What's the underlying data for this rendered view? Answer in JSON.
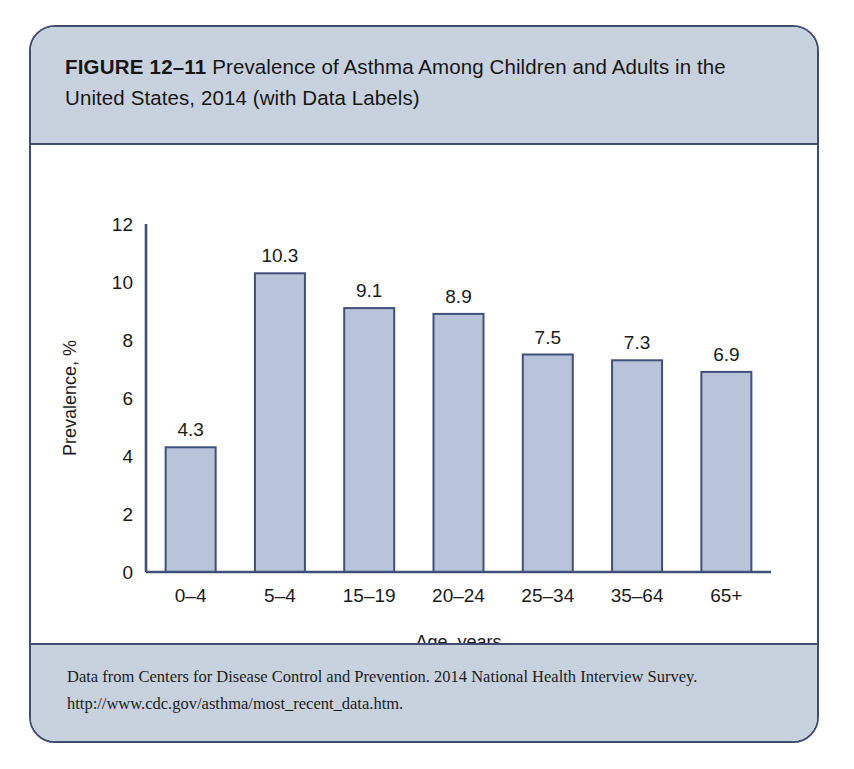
{
  "figure": {
    "number_label": "FIGURE 12–11",
    "title_rest": " Prevalence of Asthma Among Children and Adults in the United States, 2014 (with Data Labels)"
  },
  "source": {
    "line1": "Data from Centers for Disease Control and Prevention. 2014 National Health Interview Survey.",
    "line2": "http://www.cdc.gov/asthma/most_recent_data.htm."
  },
  "colors": {
    "card_border": "#414d70",
    "band_background": "#c8d2de",
    "bar_fill": "#b9c3da",
    "bar_stroke": "#41507a",
    "axis": "#41507a",
    "text": "#1a1a1a"
  },
  "chart_data": {
    "type": "bar",
    "title": "Prevalence of Asthma Among Children and Adults in the United States, 2014 (with Data Labels)",
    "xlabel": "Age, years",
    "ylabel": "Prevalence, %",
    "categories": [
      "0–4",
      "5–4",
      "15–19",
      "20–24",
      "25–34",
      "35–64",
      "65+"
    ],
    "values": [
      4.3,
      10.3,
      9.1,
      8.9,
      7.5,
      7.3,
      6.9
    ],
    "data_labels": [
      "4.3",
      "10.3",
      "9.1",
      "8.9",
      "7.5",
      "7.3",
      "6.9"
    ],
    "ylim": [
      0,
      12
    ],
    "yticks": [
      0,
      2,
      4,
      6,
      8,
      10,
      12
    ],
    "ytick_labels": [
      "0",
      "2",
      "4",
      "6",
      "8",
      "10",
      "12"
    ],
    "grid": false,
    "legend": "none"
  }
}
